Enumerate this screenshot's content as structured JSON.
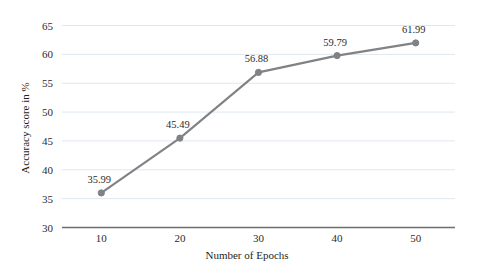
{
  "chart_data": {
    "type": "line",
    "title": "",
    "subtitle": "",
    "xlabel": "Number of Epochs",
    "ylabel": "Accuracy score in %",
    "x": [
      10,
      20,
      30,
      40,
      50
    ],
    "categories": [
      "10",
      "20",
      "30",
      "40",
      "50"
    ],
    "values": [
      35.99,
      45.49,
      56.88,
      59.79,
      61.99
    ],
    "point_labels": [
      "35.99",
      "45.49",
      "56.88",
      "59.79",
      "61.99"
    ],
    "series": [
      {
        "name": "Accuracy score in %",
        "values": [
          35.99,
          45.49,
          56.88,
          59.79,
          61.99
        ]
      }
    ],
    "xlim": [
      5,
      55
    ],
    "ylim": [
      30,
      67
    ],
    "xticks": [
      10,
      20,
      30,
      40,
      50
    ],
    "xtick_labels": [
      "10",
      "20",
      "30",
      "40",
      "50"
    ],
    "yticks": [
      30,
      35,
      40,
      45,
      50,
      55,
      60,
      65
    ],
    "ytick_labels": [
      "30",
      "35",
      "40",
      "45",
      "50",
      "55",
      "60",
      "65"
    ],
    "grid": true,
    "grid_axis": "y",
    "legend": false,
    "legend_position": "none",
    "marker": "circle",
    "show_data_labels": true,
    "colors": {
      "line": "#808285",
      "marker": "#808285",
      "gridline": "#dfe7ee",
      "axis": "#6d6e71",
      "background": "#ffffff",
      "text": "#231f20"
    }
  }
}
